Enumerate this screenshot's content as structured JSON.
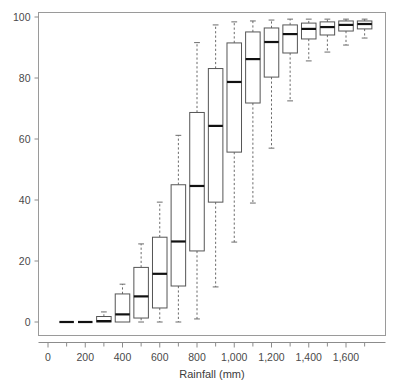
{
  "chart_data": {
    "type": "box",
    "title": "",
    "subtitle": "",
    "xlabel": "Rainfall (mm)",
    "ylabel": "",
    "xlim": [
      0,
      1750
    ],
    "ylim": [
      0,
      100
    ],
    "grid": false,
    "legend": null,
    "y_ticks": [
      0,
      20,
      40,
      60,
      80,
      100
    ],
    "y_tick_labels": [
      "0",
      "20",
      "40",
      "60",
      "80",
      "100"
    ],
    "x_ticks": [
      0,
      200,
      400,
      600,
      800,
      1000,
      1200,
      1400,
      1600
    ],
    "x_tick_labels": [
      "0",
      "200",
      "400",
      "600",
      "800",
      "1,000",
      "1,200",
      "1,400",
      "1,600"
    ],
    "x_minor_ticks": [
      100,
      300,
      500,
      700,
      900,
      1100,
      1300,
      1500,
      1700
    ],
    "categories": [
      100,
      200,
      300,
      400,
      500,
      600,
      700,
      800,
      900,
      1000,
      1100,
      1200,
      1300,
      1400,
      1500,
      1600,
      1700
    ],
    "box_width_mm": 78,
    "boxes": [
      {
        "x": 100,
        "whisker_low": 0,
        "q1": 0,
        "median": 0,
        "q3": 0,
        "whisker_high": 0
      },
      {
        "x": 200,
        "whisker_low": 0,
        "q1": 0,
        "median": 0,
        "q3": 0,
        "whisker_high": 0
      },
      {
        "x": 300,
        "whisker_low": 0,
        "q1": 0,
        "median": 0.3,
        "q3": 1.8,
        "whisker_high": 3.3
      },
      {
        "x": 400,
        "whisker_low": 0,
        "q1": 0,
        "median": 2.5,
        "q3": 9.2,
        "whisker_high": 12.4
      },
      {
        "x": 500,
        "whisker_low": 0,
        "q1": 1.3,
        "median": 8.4,
        "q3": 17.9,
        "whisker_high": 25.6
      },
      {
        "x": 600,
        "whisker_low": 0,
        "q1": 4.6,
        "median": 15.8,
        "q3": 27.8,
        "whisker_high": 39.3
      },
      {
        "x": 700,
        "whisker_low": 0,
        "q1": 11.8,
        "median": 26.4,
        "q3": 45.0,
        "whisker_high": 61.2
      },
      {
        "x": 800,
        "whisker_low": 1.0,
        "q1": 23.3,
        "median": 44.6,
        "q3": 68.7,
        "whisker_high": 91.6
      },
      {
        "x": 900,
        "whisker_low": 11.5,
        "q1": 39.3,
        "median": 64.3,
        "q3": 83.1,
        "whisker_high": 97.4
      },
      {
        "x": 1000,
        "whisker_low": 26.2,
        "q1": 55.7,
        "median": 78.7,
        "q3": 91.5,
        "whisker_high": 98.4
      },
      {
        "x": 1100,
        "whisker_low": 39.0,
        "q1": 71.8,
        "median": 86.2,
        "q3": 95.1,
        "whisker_high": 98.7
      },
      {
        "x": 1200,
        "whisker_low": 57.0,
        "q1": 80.3,
        "median": 91.8,
        "q3": 96.4,
        "whisker_high": 99.0
      },
      {
        "x": 1300,
        "whisker_low": 72.5,
        "q1": 88.2,
        "median": 94.4,
        "q3": 97.4,
        "whisker_high": 99.3
      },
      {
        "x": 1400,
        "whisker_low": 85.6,
        "q1": 92.8,
        "median": 96.1,
        "q3": 98.0,
        "whisker_high": 99.3
      },
      {
        "x": 1500,
        "whisker_low": 88.5,
        "q1": 94.1,
        "median": 96.7,
        "q3": 98.4,
        "whisker_high": 99.3
      },
      {
        "x": 1600,
        "whisker_low": 90.8,
        "q1": 95.4,
        "median": 97.4,
        "q3": 98.7,
        "whisker_high": 99.3
      },
      {
        "x": 1700,
        "whisker_low": 93.1,
        "q1": 96.1,
        "median": 97.7,
        "q3": 98.7,
        "whisker_high": 99.3
      }
    ]
  },
  "colors": {
    "box_stroke": "#555555",
    "median": "#111111",
    "whisker": "#6b6b6b",
    "frame": "#9a9a9a",
    "text": "#4a4a4a",
    "background": "#ffffff"
  }
}
